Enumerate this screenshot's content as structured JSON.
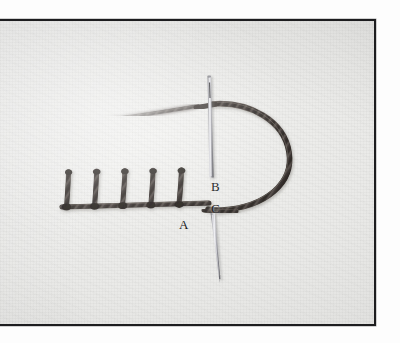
{
  "image": {
    "kind": "photograph",
    "subject": "blanket-stitch-embroidery-demonstration",
    "description": "Close-up photograph of a row of blanket stitches worked in dark thread on pale fabric, with a steel needle passing through the cloth and a looped working thread.",
    "frame": {
      "border_color": "#1d1d1f",
      "border_width_px": 2
    },
    "background": {
      "fabric_color": "#eaeae8",
      "fabric_highlight": "#f2f2f0",
      "fabric_shadow": "#d9d9d6"
    }
  },
  "labels": {
    "a": "A",
    "b": "B",
    "c": "C",
    "color": "#17171a"
  },
  "thread": {
    "color": "#4a4441",
    "dark_color": "#2c2724",
    "light_color": "#6f6762",
    "stitch_count": 5
  },
  "needle": {
    "body_color": "#8e8e90",
    "highlight_color": "#e2e2e4",
    "shadow_color": "#55555a",
    "eye_color": "#2a2a2d",
    "upper_label": "B",
    "lower_label": "C"
  },
  "annotations": [
    {
      "id": "A",
      "meaning": "base-of-last-completed-stitch"
    },
    {
      "id": "B",
      "meaning": "needle-exit-point-upper"
    },
    {
      "id": "C",
      "meaning": "needle-entry-point-lower"
    }
  ]
}
